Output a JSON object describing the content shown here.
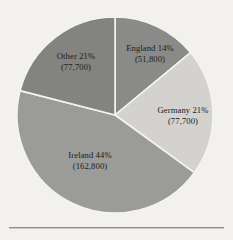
{
  "figure": {
    "background_color": "#f2f1ef",
    "rule_color": "#8e8d8b",
    "label_color": "#20201f",
    "separator_color": "#f4f3f1"
  },
  "chart_data": {
    "type": "pie",
    "title": "",
    "subtitle": "",
    "xlabel": "",
    "ylabel": "",
    "grid": false,
    "legend_position": "none",
    "labels_inside_slices": true,
    "start_angle_deg": 0,
    "direction": "clockwise",
    "center": {
      "x": 115,
      "y": 115
    },
    "radius": 98,
    "categories": [
      "England",
      "Germany",
      "Ireland",
      "Other"
    ],
    "values": [
      14,
      21,
      44,
      21
    ],
    "counts": [
      51800,
      77700,
      162800,
      77700
    ],
    "value_unit": "%",
    "slices": [
      {
        "name": "England",
        "percent": 14,
        "count": 51800,
        "label_line1": "England 14%",
        "label_line2": "(51,800)",
        "color": "#8a8a88",
        "start_angle_deg": 0,
        "end_angle_deg": 50.4,
        "label_x": 150,
        "label_y": 51
      },
      {
        "name": "Germany",
        "percent": 21,
        "count": 77700,
        "label_line1": "Germany 21%",
        "label_line2": "(77,700)",
        "color": "#d3d2cf",
        "start_angle_deg": 50.4,
        "end_angle_deg": 126.0,
        "label_x": 183,
        "label_y": 113
      },
      {
        "name": "Ireland",
        "percent": 44,
        "count": 162800,
        "label_line1": "Ireland 44%",
        "label_line2": "(162,800)",
        "color": "#9b9b99",
        "start_angle_deg": 126.0,
        "end_angle_deg": 284.4,
        "label_x": 90,
        "label_y": 158
      },
      {
        "name": "Other",
        "percent": 21,
        "count": 77700,
        "label_line1": "Other 21%",
        "label_line2": "(77,700)",
        "color": "#83837f",
        "start_angle_deg": 284.4,
        "end_angle_deg": 360.0,
        "label_x": 76,
        "label_y": 59
      }
    ]
  }
}
